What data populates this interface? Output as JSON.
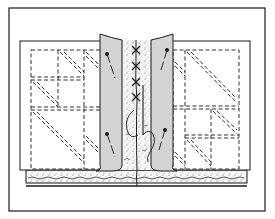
{
  "diagram": {
    "colors": {
      "background": "#ffffff",
      "ink": "#1a1a1a",
      "flap_fill": "#d4d4d4",
      "batting_fill": "#f4f4f4"
    },
    "frame": {
      "x": 9,
      "y": 8,
      "w": 256,
      "h": 203
    },
    "blocks": [
      {
        "name": "left-quilt-block",
        "x": 20,
        "y": 41,
        "w": 120,
        "h": 129
      },
      {
        "name": "right-quilt-block",
        "x": 140,
        "y": 41,
        "w": 110,
        "h": 129
      }
    ],
    "flaps": [
      {
        "name": "left-backing-flap",
        "x": 100,
        "y": 34,
        "w": 22,
        "h": 133
      },
      {
        "name": "right-backing-flap",
        "x": 151,
        "y": 34,
        "w": 22,
        "h": 133
      }
    ],
    "pins": [
      {
        "name": "pin-top-left",
        "head": [
          107,
          54
        ],
        "tail": [
          115,
          78
        ]
      },
      {
        "name": "pin-bottom-left",
        "head": [
          107,
          134
        ],
        "tail": [
          115,
          157
        ]
      },
      {
        "name": "pin-top-right",
        "head": [
          167,
          50
        ],
        "tail": [
          161,
          70
        ]
      },
      {
        "name": "pin-bottom-right",
        "head": [
          165,
          130
        ],
        "tail": [
          159,
          150
        ]
      }
    ],
    "cross_stitches": [
      {
        "x": 136,
        "y": 50
      },
      {
        "x": 136,
        "y": 66
      },
      {
        "x": 136,
        "y": 82
      },
      {
        "x": 136,
        "y": 97
      }
    ],
    "labels": []
  }
}
